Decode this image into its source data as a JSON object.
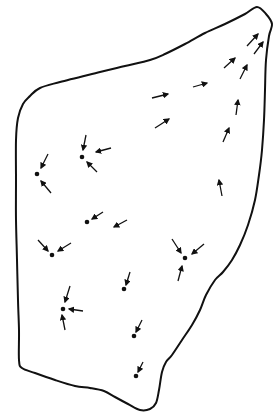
{
  "diagram": {
    "title": "",
    "stroke_color": "#111111",
    "background": "#ffffff",
    "outline": {
      "points": [
        [
          30,
          96
        ],
        [
          40,
          88
        ],
        [
          60,
          82
        ],
        [
          100,
          72
        ],
        [
          125,
          66
        ],
        [
          150,
          60
        ],
        [
          165,
          54
        ],
        [
          185,
          44
        ],
        [
          205,
          33
        ],
        [
          225,
          24
        ],
        [
          245,
          14
        ],
        [
          257,
          7
        ],
        [
          266,
          14
        ],
        [
          272,
          24
        ],
        [
          269,
          36
        ],
        [
          266,
          60
        ],
        [
          265,
          90
        ],
        [
          264,
          120
        ],
        [
          262,
          150
        ],
        [
          259,
          175
        ],
        [
          255,
          200
        ],
        [
          248,
          225
        ],
        [
          240,
          245
        ],
        [
          232,
          260
        ],
        [
          223,
          272
        ],
        [
          215,
          280
        ],
        [
          206,
          295
        ],
        [
          200,
          310
        ],
        [
          192,
          325
        ],
        [
          182,
          340
        ],
        [
          172,
          355
        ],
        [
          166,
          362
        ],
        [
          162,
          372
        ],
        [
          159,
          390
        ],
        [
          156,
          403
        ],
        [
          150,
          409
        ],
        [
          140,
          410
        ],
        [
          128,
          404
        ],
        [
          115,
          397
        ],
        [
          104,
          391
        ],
        [
          90,
          388
        ],
        [
          75,
          386
        ],
        [
          55,
          380
        ],
        [
          35,
          373
        ],
        [
          22,
          368
        ],
        [
          19,
          360
        ],
        [
          19,
          330
        ],
        [
          18,
          300
        ],
        [
          17,
          260
        ],
        [
          16,
          220
        ],
        [
          16,
          180
        ],
        [
          16,
          140
        ],
        [
          18,
          118
        ],
        [
          23,
          104
        ]
      ]
    },
    "sinks": [
      {
        "id": "sink-1",
        "x": 82,
        "y": 157
      },
      {
        "id": "sink-2",
        "x": 37,
        "y": 174
      },
      {
        "id": "sink-3",
        "x": 87,
        "y": 222
      },
      {
        "id": "sink-4",
        "x": 52,
        "y": 255
      },
      {
        "id": "sink-5",
        "x": 185,
        "y": 258
      },
      {
        "id": "sink-6",
        "x": 124,
        "y": 289
      },
      {
        "id": "sink-7",
        "x": 63,
        "y": 309
      },
      {
        "id": "sink-8",
        "x": 134,
        "y": 336
      },
      {
        "id": "sink-9",
        "x": 136,
        "y": 376
      }
    ],
    "arrows": [
      {
        "x1": 247,
        "y1": 46,
        "x2": 258,
        "y2": 34
      },
      {
        "x1": 254,
        "y1": 54,
        "x2": 263,
        "y2": 42
      },
      {
        "x1": 224,
        "y1": 68,
        "x2": 235,
        "y2": 58
      },
      {
        "x1": 240,
        "y1": 79,
        "x2": 247,
        "y2": 65
      },
      {
        "x1": 193,
        "y1": 87,
        "x2": 207,
        "y2": 83
      },
      {
        "x1": 152,
        "y1": 98,
        "x2": 168,
        "y2": 94
      },
      {
        "x1": 155,
        "y1": 128,
        "x2": 169,
        "y2": 119
      },
      {
        "x1": 236,
        "y1": 115,
        "x2": 238,
        "y2": 100
      },
      {
        "x1": 223,
        "y1": 142,
        "x2": 229,
        "y2": 128
      },
      {
        "x1": 222,
        "y1": 196,
        "x2": 219,
        "y2": 180
      },
      {
        "x1": 86,
        "y1": 135,
        "x2": 83,
        "y2": 150
      },
      {
        "x1": 111,
        "y1": 148,
        "x2": 96,
        "y2": 152
      },
      {
        "x1": 97,
        "y1": 172,
        "x2": 87,
        "y2": 162
      },
      {
        "x1": 48,
        "y1": 154,
        "x2": 41,
        "y2": 168
      },
      {
        "x1": 51,
        "y1": 193,
        "x2": 41,
        "y2": 181
      },
      {
        "x1": 103,
        "y1": 212,
        "x2": 92,
        "y2": 219
      },
      {
        "x1": 127,
        "y1": 220,
        "x2": 114,
        "y2": 227
      },
      {
        "x1": 38,
        "y1": 240,
        "x2": 48,
        "y2": 251
      },
      {
        "x1": 71,
        "y1": 243,
        "x2": 58,
        "y2": 251
      },
      {
        "x1": 172,
        "y1": 239,
        "x2": 181,
        "y2": 253
      },
      {
        "x1": 204,
        "y1": 244,
        "x2": 192,
        "y2": 254
      },
      {
        "x1": 178,
        "y1": 281,
        "x2": 182,
        "y2": 266
      },
      {
        "x1": 130,
        "y1": 272,
        "x2": 126,
        "y2": 285
      },
      {
        "x1": 70,
        "y1": 286,
        "x2": 65,
        "y2": 302
      },
      {
        "x1": 83,
        "y1": 311,
        "x2": 69,
        "y2": 309
      },
      {
        "x1": 65,
        "y1": 330,
        "x2": 62,
        "y2": 315
      },
      {
        "x1": 142,
        "y1": 320,
        "x2": 136,
        "y2": 332
      },
      {
        "x1": 143,
        "y1": 362,
        "x2": 138,
        "y2": 372
      }
    ]
  }
}
